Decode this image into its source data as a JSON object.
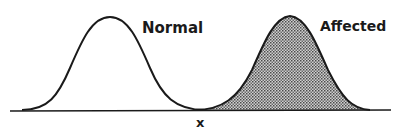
{
  "diagram": {
    "curves": [
      {
        "name": "Normal",
        "label": "Normal",
        "filled": false,
        "peak_x": 110
      },
      {
        "name": "Affected",
        "label": "Affected",
        "filled": true,
        "peak_x": 290
      }
    ],
    "threshold_label": "x",
    "colors": {
      "line": "#1a1a1a",
      "fill_dark": "#555555",
      "fill_light": "#d8d8d8",
      "background": "#ffffff"
    }
  }
}
